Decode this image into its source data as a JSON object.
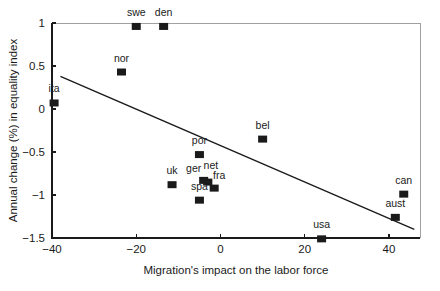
{
  "chart_data": {
    "type": "scatter",
    "title": "",
    "xlabel": "Migration's impact on the labor force",
    "ylabel": "Annual change (%) in equality index",
    "xlim": [
      -40,
      48
    ],
    "ylim": [
      -1.5,
      1
    ],
    "xticks": [
      "-40",
      "-20",
      "0",
      "20",
      "40"
    ],
    "xtickvalues": [
      -40,
      -20,
      0,
      20,
      40
    ],
    "yticks": [
      "1",
      "0.5",
      "0",
      "-0.5",
      "-1",
      "-1.5"
    ],
    "ytickvalues": [
      1,
      0.5,
      0,
      -0.5,
      -1,
      -1.5
    ],
    "grid": false,
    "legend": "none",
    "marker_shape": "square",
    "marker_color": "#1a1a1a",
    "points": [
      {
        "label": "swe",
        "x": -20.0,
        "y": 0.96,
        "label_dx": 0,
        "label_dy": -7
      },
      {
        "label": "den",
        "x": -13.5,
        "y": 0.96,
        "label_dx": 0,
        "label_dy": -7
      },
      {
        "label": "nor",
        "x": -23.5,
        "y": 0.43,
        "label_dx": 0,
        "label_dy": -7
      },
      {
        "label": "ita",
        "x": -39.5,
        "y": 0.07,
        "label_dx": 0,
        "label_dy": -7
      },
      {
        "label": "bel",
        "x": 10.0,
        "y": -0.35,
        "label_dx": 0,
        "label_dy": -7
      },
      {
        "label": "por",
        "x": -5.0,
        "y": -0.53,
        "label_dx": 0,
        "label_dy": -7
      },
      {
        "label": "uk",
        "x": -11.5,
        "y": -0.88,
        "label_dx": 0,
        "label_dy": -7
      },
      {
        "label": "ger",
        "x": -4.0,
        "y": -0.83,
        "label_dx": -10,
        "label_dy": -5
      },
      {
        "label": "net",
        "x": -3.0,
        "y": -0.85,
        "label_dx": 3,
        "label_dy": -10
      },
      {
        "label": "fra",
        "x": -1.5,
        "y": -0.92,
        "label_dx": 5,
        "label_dy": -6
      },
      {
        "label": "spa",
        "x": -5.0,
        "y": -1.06,
        "label_dx": 0,
        "label_dy": -7
      },
      {
        "label": "usa",
        "x": 24.0,
        "y": -1.51,
        "label_dx": 0,
        "label_dy": -7
      },
      {
        "label": "can",
        "x": 43.5,
        "y": -0.99,
        "label_dx": 0,
        "label_dy": -7
      },
      {
        "label": "aust",
        "x": 41.5,
        "y": -1.26,
        "label_dx": 0,
        "label_dy": -7
      }
    ],
    "trendline": {
      "x0": -38.0,
      "y0": 0.38,
      "x1": 46.0,
      "y1": -1.4
    }
  }
}
